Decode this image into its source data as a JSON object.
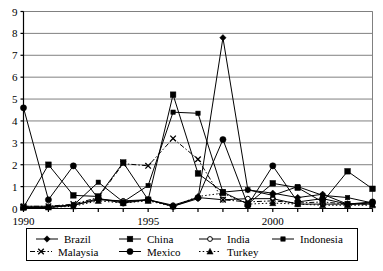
{
  "chart_data": {
    "type": "line",
    "title": "",
    "xlabel": "",
    "ylabel": "",
    "xlim": [
      1990,
      2004
    ],
    "ylim": [
      0,
      9
    ],
    "grid": true,
    "legend_position": "bottom",
    "x": [
      1990,
      1991,
      1992,
      1993,
      1994,
      1995,
      1996,
      1997,
      1998,
      1999,
      2000,
      2001,
      2002,
      2003,
      2004
    ],
    "xtick_labels": [
      "1990",
      "1995",
      "2000"
    ],
    "xtick_values": [
      1990,
      1995,
      2000
    ],
    "ytick_labels": [
      "0",
      "1",
      "2",
      "3",
      "4",
      "5",
      "6",
      "7",
      "8",
      "9"
    ],
    "ytick_values": [
      0,
      1,
      2,
      3,
      4,
      5,
      6,
      7,
      8,
      9
    ],
    "series": [
      {
        "name": "Brazil",
        "marker": "diamond",
        "line": "solid",
        "values": [
          0.05,
          0.05,
          0.15,
          0.45,
          0.3,
          0.4,
          0.1,
          0.45,
          7.8,
          0.85,
          0.7,
          0.5,
          0.65,
          0.2,
          0.25
        ]
      },
      {
        "name": "China",
        "marker": "square",
        "line": "solid",
        "values": [
          0.05,
          2.0,
          0.6,
          0.55,
          2.1,
          0.4,
          5.2,
          1.6,
          0.75,
          0.2,
          1.15,
          0.95,
          0.3,
          1.7,
          0.9
        ]
      },
      {
        "name": "India",
        "marker": "circle-open",
        "line": "solid",
        "values": [
          0.1,
          0.1,
          0.15,
          0.4,
          0.35,
          0.4,
          0.15,
          0.5,
          0.4,
          0.45,
          0.45,
          0.2,
          0.2,
          0.2,
          0.2
        ]
      },
      {
        "name": "Indonesia",
        "marker": "square-small",
        "line": "solid",
        "values": [
          0.05,
          0.05,
          0.15,
          1.2,
          0.3,
          1.05,
          4.4,
          4.35,
          0.75,
          0.85,
          0.6,
          1.0,
          0.6,
          0.5,
          0.25
        ]
      },
      {
        "name": "Malaysia",
        "marker": "x",
        "line": "dash-dot",
        "values": [
          0.1,
          0.1,
          0.2,
          0.5,
          2.05,
          1.95,
          3.2,
          2.25,
          0.4,
          0.3,
          0.35,
          0.25,
          0.3,
          0.2,
          0.2
        ]
      },
      {
        "name": "Mexico",
        "marker": "circle",
        "line": "solid",
        "values": [
          4.6,
          0.4,
          1.95,
          0.45,
          0.25,
          0.4,
          0.1,
          0.5,
          3.15,
          0.15,
          1.95,
          0.3,
          0.45,
          0.2,
          0.3
        ]
      },
      {
        "name": "Turkey",
        "marker": "triangle",
        "line": "dotted",
        "values": [
          0.05,
          0.05,
          0.1,
          0.35,
          0.25,
          0.35,
          0.1,
          0.55,
          0.7,
          0.2,
          0.25,
          0.2,
          0.15,
          0.15,
          0.15
        ]
      }
    ]
  },
  "legend": {
    "entries": [
      {
        "label": "Brazil"
      },
      {
        "label": "China"
      },
      {
        "label": "India"
      },
      {
        "label": "Indonesia"
      },
      {
        "label": "Malaysia"
      },
      {
        "label": "Mexico"
      },
      {
        "label": "Turkey"
      }
    ]
  },
  "colors": {
    "ink": "#000000",
    "grid": "#808080",
    "background": "#ffffff"
  }
}
